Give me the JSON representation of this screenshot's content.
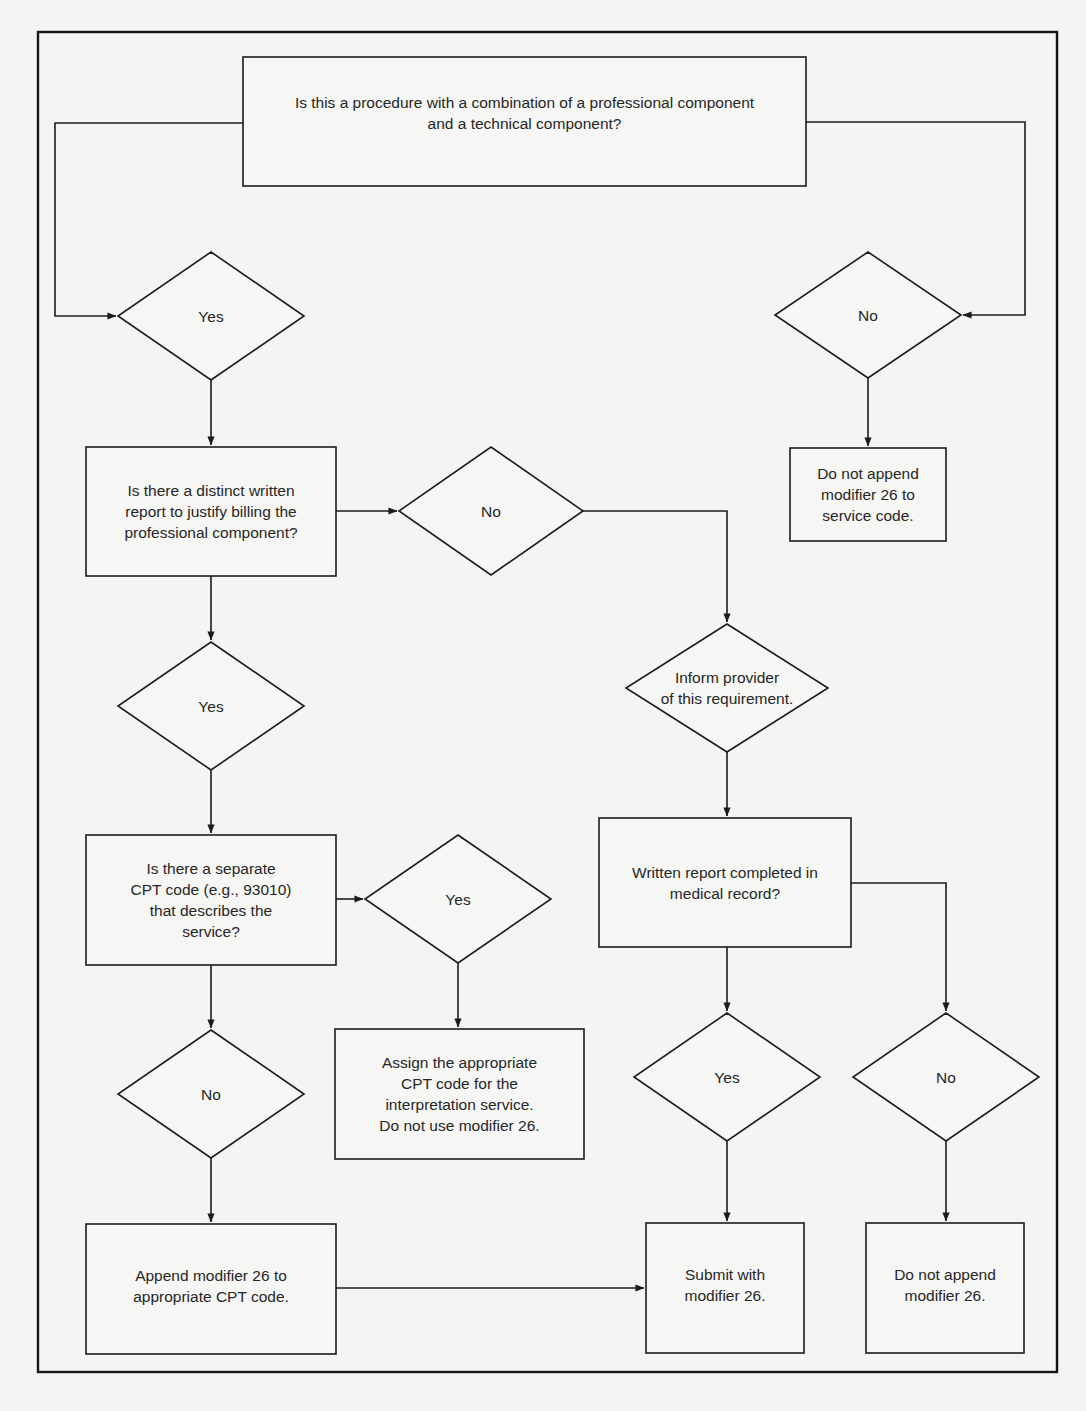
{
  "diagram": {
    "title": "",
    "colors": {
      "line": "#1c1c1c",
      "background": "#f4f4f2",
      "text": "#262626"
    },
    "nodes": {
      "q_combination": {
        "type": "process-box",
        "text": "Is this a procedure with a combination of a professional component\nand a technical component?"
      },
      "d_yes_1": {
        "type": "decision",
        "text": "Yes"
      },
      "d_no_1": {
        "type": "decision",
        "text": "No"
      },
      "b_no_mod_service": {
        "type": "process-box",
        "text": "Do not append\nmodifier 26 to\nservice code."
      },
      "q_written_report": {
        "type": "process-box",
        "text": "Is there a distinct written\nreport to justify billing the\nprofessional component?"
      },
      "d_no_2": {
        "type": "decision",
        "text": "No"
      },
      "d_inform": {
        "type": "decision",
        "text": "Inform provider\nof this requirement."
      },
      "d_yes_2": {
        "type": "decision",
        "text": "Yes"
      },
      "q_separate_cpt": {
        "type": "process-box",
        "text": "Is there a separate\nCPT code (e.g., 93010)\nthat describes the\nservice?"
      },
      "d_yes_3": {
        "type": "decision",
        "text": "Yes"
      },
      "b_written_completed": {
        "type": "process-box",
        "text": "Written report completed in\nmedical record?"
      },
      "b_assign_cpt": {
        "type": "process-box",
        "text": "Assign the appropriate\nCPT code for the\ninterpretation service.\nDo not use modifier 26."
      },
      "d_no_3": {
        "type": "decision",
        "text": "No"
      },
      "d_yes_4": {
        "type": "decision",
        "text": "Yes"
      },
      "d_no_4": {
        "type": "decision",
        "text": "No"
      },
      "b_append_mod": {
        "type": "process-box",
        "text": "Append modifier 26 to\nappropriate CPT code."
      },
      "b_submit": {
        "type": "process-box",
        "text": "Submit with\nmodifier 26."
      },
      "b_no_append": {
        "type": "process-box",
        "text": "Do not append\nmodifier 26."
      }
    },
    "edges": [
      {
        "from": "q_combination",
        "to": "d_yes_1"
      },
      {
        "from": "q_combination",
        "to": "d_no_1"
      },
      {
        "from": "d_no_1",
        "to": "b_no_mod_service"
      },
      {
        "from": "d_yes_1",
        "to": "q_written_report"
      },
      {
        "from": "q_written_report",
        "to": "d_no_2"
      },
      {
        "from": "d_no_2",
        "to": "d_inform"
      },
      {
        "from": "d_inform",
        "to": "b_written_completed"
      },
      {
        "from": "q_written_report",
        "to": "d_yes_2"
      },
      {
        "from": "d_yes_2",
        "to": "q_separate_cpt"
      },
      {
        "from": "q_separate_cpt",
        "to": "d_yes_3"
      },
      {
        "from": "d_yes_3",
        "to": "b_assign_cpt"
      },
      {
        "from": "q_separate_cpt",
        "to": "d_no_3"
      },
      {
        "from": "d_no_3",
        "to": "b_append_mod"
      },
      {
        "from": "b_append_mod",
        "to": "b_submit"
      },
      {
        "from": "b_written_completed",
        "to": "d_yes_4"
      },
      {
        "from": "b_written_completed",
        "to": "d_no_4"
      },
      {
        "from": "d_yes_4",
        "to": "b_submit"
      },
      {
        "from": "d_no_4",
        "to": "b_no_append"
      }
    ]
  }
}
